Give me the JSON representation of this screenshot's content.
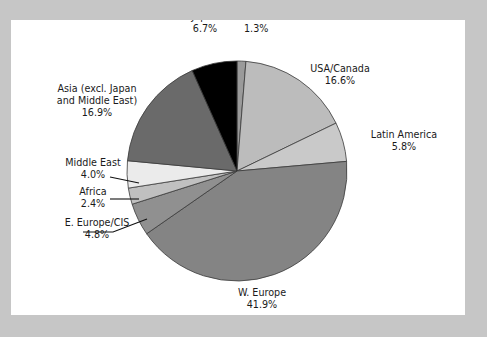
{
  "figure": {
    "background_color": "#c6c6c6",
    "panel_color": "#ffffff",
    "label_color": "#1a1a1a",
    "slice_outline_color": "#3a3a3a"
  },
  "chart_data": {
    "type": "pie",
    "title": "",
    "subtitle": "",
    "xlabel": "",
    "ylabel": "",
    "legend_position": "none",
    "grid": false,
    "label_format": "name + percent",
    "start_angle_deg": -90,
    "direction": "clockwise",
    "center": {
      "x": 237,
      "y": 171
    },
    "radius": 110,
    "total_percent": 100.0,
    "categories": [
      "Oceania",
      "USA/Canada",
      "Latin America",
      "W. Europe",
      "E. Europe/CIS",
      "Africa",
      "Middle East",
      "Asia (excl. Japan and Middle East)",
      "Japan"
    ],
    "values": [
      1.3,
      16.6,
      5.8,
      41.9,
      4.8,
      2.4,
      4.0,
      16.9,
      6.7
    ],
    "colors": [
      "#9a9a9a",
      "#bcbcbc",
      "#c9c9c9",
      "#848484",
      "#909090",
      "#c0c0c0",
      "#ebebeb",
      "#6a6a6a",
      "#000000"
    ],
    "slices": [
      {
        "name": "Oceania",
        "value": 1.3,
        "percent_label": "1.3%",
        "color": "#9a9a9a",
        "label_lines": [
          "Oceania",
          "1.3%"
        ],
        "label_x": 244,
        "label_y": 20,
        "label_anchor": "start",
        "leader": false
      },
      {
        "name": "USA/Canada",
        "value": 16.6,
        "percent_label": "16.6%",
        "color": "#bcbcbc",
        "label_lines": [
          "USA/Canada",
          "16.6%"
        ],
        "label_x": 340,
        "label_y": 72,
        "label_anchor": "middle",
        "leader": false
      },
      {
        "name": "Latin America",
        "value": 5.8,
        "percent_label": "5.8%",
        "color": "#c9c9c9",
        "label_lines": [
          "Latin America",
          "5.8%"
        ],
        "label_x": 404,
        "label_y": 138,
        "label_anchor": "middle",
        "leader": false
      },
      {
        "name": "W. Europe",
        "value": 41.9,
        "percent_label": "41.9%",
        "color": "#848484",
        "label_lines": [
          "W. Europe",
          "41.9%"
        ],
        "label_x": 262,
        "label_y": 296,
        "label_anchor": "middle",
        "leader": false
      },
      {
        "name": "E. Europe/CIS",
        "value": 4.8,
        "percent_label": "4.8%",
        "color": "#909090",
        "label_lines": [
          "E. Europe/CIS",
          "4.8%"
        ],
        "label_x": 97,
        "label_y": 226,
        "label_anchor": "middle",
        "leader": true,
        "leader_points": "83,232 113,232 147,219"
      },
      {
        "name": "Africa",
        "value": 2.4,
        "percent_label": "2.4%",
        "color": "#c0c0c0",
        "label_lines": [
          "Africa",
          "2.4%"
        ],
        "label_x": 93,
        "label_y": 195,
        "label_anchor": "middle",
        "leader": true,
        "leader_points": "110,199 139,199"
      },
      {
        "name": "Middle East",
        "value": 4.0,
        "percent_label": "4.0%",
        "color": "#ebebeb",
        "label_lines": [
          "Middle East",
          "4.0%"
        ],
        "label_x": 93,
        "label_y": 166,
        "label_anchor": "middle",
        "leader": true,
        "leader_points": "110,177 139,183"
      },
      {
        "name": "Asia (excl. Japan and Middle East)",
        "value": 16.9,
        "percent_label": "16.9%",
        "color": "#6a6a6a",
        "label_lines": [
          "Asia (excl. Japan",
          "and Middle East)",
          "16.9%"
        ],
        "label_x": 97,
        "label_y": 92,
        "label_anchor": "middle",
        "leader": false
      },
      {
        "name": "Japan",
        "value": 6.7,
        "percent_label": "6.7%",
        "color": "#000000",
        "label_lines": [
          "Japan",
          "6.7%"
        ],
        "label_x": 205,
        "label_y": 20,
        "label_anchor": "middle",
        "leader": false
      }
    ]
  }
}
